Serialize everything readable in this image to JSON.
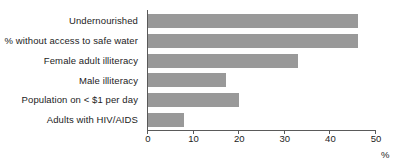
{
  "chart_data": {
    "type": "bar",
    "orientation": "horizontal",
    "title": "",
    "subtitle": "",
    "xlabel": "%",
    "ylabel": "",
    "categories": [
      "Undernourished",
      "% without access to safe water",
      "Female adult illiteracy",
      "Male illiteracy",
      "Population on < $1 per day",
      "Adults with HIV/AIDS"
    ],
    "values": [
      46,
      46,
      33,
      17,
      20,
      8
    ],
    "xlim": [
      0,
      50
    ],
    "xticks": [
      0,
      10,
      20,
      30,
      40,
      50
    ],
    "xtick_labels": [
      "0",
      "10",
      "20",
      "30",
      "40",
      "50"
    ],
    "grid": false,
    "legend": false,
    "bar_color": "#999999",
    "axis_color": "#5a5a5a",
    "text_color": "#1c1c1c",
    "background_color": "#ffffff"
  }
}
